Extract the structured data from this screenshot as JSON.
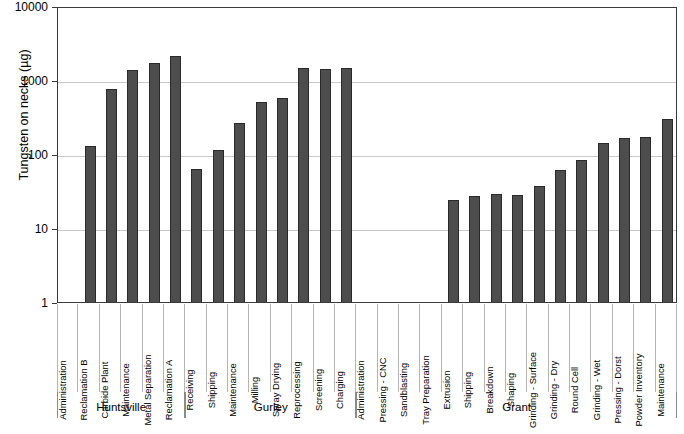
{
  "chart_data": {
    "type": "bar",
    "title": "",
    "xlabel": "",
    "ylabel": "Tungsten on necks (µg)",
    "yscale": "log",
    "ylim": [
      1,
      10000
    ],
    "ytick_labels": [
      "10000",
      "1000",
      "100",
      "10",
      "1"
    ],
    "ytick_values": [
      10000,
      1000,
      100,
      10,
      1
    ],
    "grid": true,
    "legend": "none",
    "groups": [
      {
        "name": "Huntsville",
        "categories": [
          "Administration",
          "Reclamation B",
          "Carbide Plant",
          "Maintenance",
          "Metal Separation",
          "Reclamation A"
        ],
        "values": [
          null,
          130,
          760,
          1350,
          1700,
          2100
        ]
      },
      {
        "name": "Gurley",
        "categories": [
          "Receiving",
          "Shipping",
          "Maintenance",
          "Milling",
          "Spray Drying",
          "Reprocessing",
          "Screening",
          "Charging"
        ],
        "values": [
          63,
          115,
          265,
          500,
          580,
          1450,
          1430,
          1470
        ]
      },
      {
        "name": "Grant",
        "categories": [
          "Administration",
          "Pressing - CNC",
          "Sandblasting",
          "Tray Preparation",
          "Extrusion",
          "Shipping",
          "Breakdown",
          "Shaping",
          "Grinding - Surface",
          "Grinding - Dry",
          "Round Cell",
          "Grinding - Wet",
          "Pressing - Dorst",
          "Powder Inventory",
          "Maintenance"
        ],
        "values": [
          null,
          null,
          null,
          null,
          24,
          27,
          29,
          28,
          37,
          60,
          83,
          140,
          165,
          170,
          295
        ]
      }
    ],
    "categories": [
      "Administration",
      "Reclamation B",
      "Carbide Plant",
      "Maintenance",
      "Metal Separation",
      "Reclamation A",
      "Receiving",
      "Shipping",
      "Maintenance",
      "Milling",
      "Spray Drying",
      "Reprocessing",
      "Screening",
      "Charging",
      "Administration",
      "Pressing - CNC",
      "Sandblasting",
      "Tray Preparation",
      "Extrusion",
      "Shipping",
      "Breakdown",
      "Shaping",
      "Grinding - Surface",
      "Grinding - Dry",
      "Round Cell",
      "Grinding - Wet",
      "Pressing - Dorst",
      "Powder Inventory",
      "Maintenance"
    ],
    "values": [
      null,
      130,
      760,
      1350,
      1700,
      2100,
      63,
      115,
      265,
      500,
      580,
      1450,
      1430,
      1470,
      null,
      null,
      null,
      null,
      24,
      27,
      29,
      28,
      37,
      60,
      83,
      140,
      165,
      170,
      295
    ],
    "bar_color": "#4d4d4d"
  }
}
